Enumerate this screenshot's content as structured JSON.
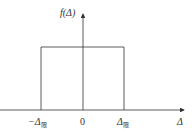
{
  "diagram": {
    "title": "",
    "y_axis_label": "f(Δ)",
    "x_axis_label": "Δ",
    "ticks": [
      {
        "label_main": "−Δ",
        "label_sub": "限"
      },
      {
        "label_main": "0",
        "label_sub": ""
      },
      {
        "label_main": "Δ",
        "label_sub": "限"
      }
    ],
    "shape": "rectangular distribution (uniform) from −Δ限 to Δ限",
    "colors": {
      "line": "#333333",
      "background": "#ffffff"
    }
  }
}
